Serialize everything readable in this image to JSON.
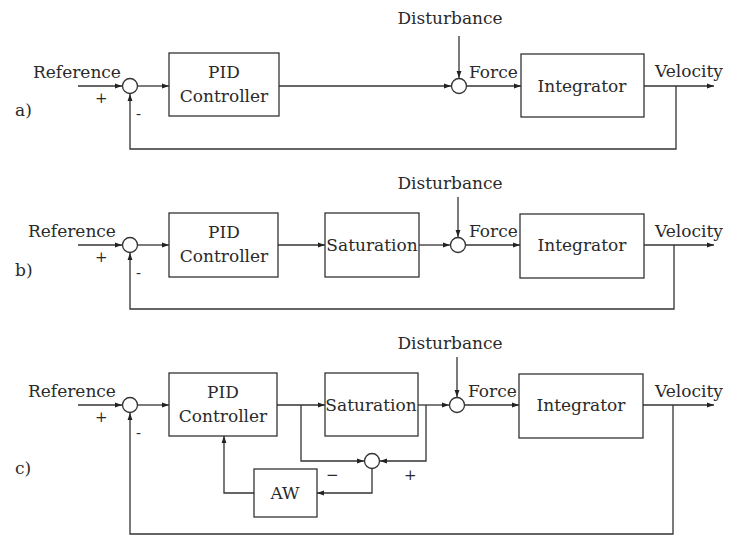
{
  "figure": {
    "panels": [
      {
        "id": "a",
        "tag": "a)",
        "input_label": "Reference",
        "input_sign": "+",
        "feedback_sign": "-",
        "disturbance_label": "Disturbance",
        "force_label": "Force",
        "output_label": "Velocity",
        "blocks": {
          "controller_line1": "PID",
          "controller_line2": "Controller",
          "plant": "Integrator"
        }
      },
      {
        "id": "b",
        "tag": "b)",
        "input_label": "Reference",
        "input_sign": "+",
        "feedback_sign": "-",
        "disturbance_label": "Disturbance",
        "force_label": "Force",
        "output_label": "Velocity",
        "blocks": {
          "controller_line1": "PID",
          "controller_line2": "Controller",
          "saturation": "Saturation",
          "plant": "Integrator"
        }
      },
      {
        "id": "c",
        "tag": "c)",
        "input_label": "Reference",
        "input_sign": "+",
        "feedback_sign": "-",
        "disturbance_label": "Disturbance",
        "force_label": "Force",
        "output_label": "Velocity",
        "aw_minus_sign": "−",
        "aw_plus_sign": "+",
        "blocks": {
          "controller_line1": "PID",
          "controller_line2": "Controller",
          "saturation": "Saturation",
          "plant": "Integrator",
          "antiwindup": "AW"
        }
      }
    ]
  }
}
